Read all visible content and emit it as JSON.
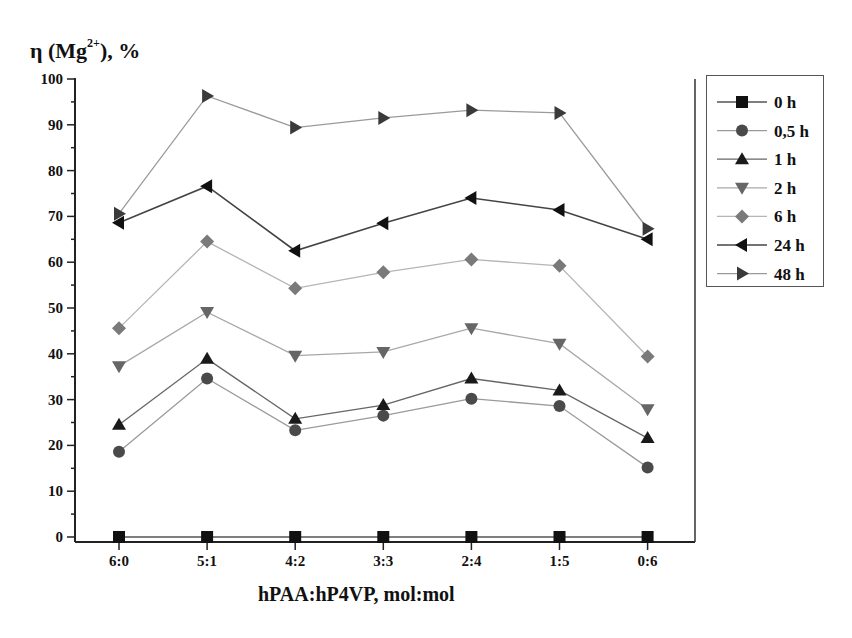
{
  "chart_data": {
    "type": "line",
    "title": "",
    "ylabel": "η (Mg²⁺), %",
    "ylabel_main": "η (Mg",
    "ylabel_sup": "2+",
    "ylabel_tail": "), %",
    "xlabel": "hPAA:hP4VP, mol:mol",
    "categories": [
      "6:0",
      "5:1",
      "4:2",
      "3:3",
      "2:4",
      "1:5",
      "0:6"
    ],
    "ylim": [
      0,
      100
    ],
    "yticks": [
      0,
      10,
      20,
      30,
      40,
      50,
      60,
      70,
      80,
      90,
      100
    ],
    "grid": false,
    "legend_position": "right-outside-top",
    "series": [
      {
        "name": "0 h",
        "marker": "square",
        "color": "#111111",
        "line_color": "#555555",
        "values": [
          0,
          0,
          0,
          0,
          0,
          0,
          0
        ]
      },
      {
        "name": "0,5 h",
        "marker": "circle",
        "color": "#4a4a4a",
        "line_color": "#9a9a9a",
        "values": [
          18.6,
          34.6,
          23.3,
          26.5,
          30.2,
          28.6,
          15.2
        ]
      },
      {
        "name": "1 h",
        "marker": "triangle-up",
        "color": "#1a1a1a",
        "line_color": "#666666",
        "values": [
          24.5,
          38.9,
          25.8,
          28.8,
          34.6,
          32.0,
          21.6
        ]
      },
      {
        "name": "2 h",
        "marker": "triangle-down",
        "color": "#666666",
        "line_color": "#a8a8a8",
        "values": [
          37.3,
          49.1,
          39.6,
          40.4,
          45.6,
          42.2,
          27.9
        ]
      },
      {
        "name": "6 h",
        "marker": "diamond",
        "color": "#7a7a7a",
        "line_color": "#b5b5b5",
        "values": [
          45.6,
          64.5,
          54.3,
          57.8,
          60.6,
          59.2,
          39.4
        ]
      },
      {
        "name": "24 h",
        "marker": "triangle-left",
        "color": "#111111",
        "line_color": "#444444",
        "values": [
          68.6,
          76.6,
          62.5,
          68.5,
          74.0,
          71.4,
          65.0
        ]
      },
      {
        "name": "48 h",
        "marker": "triangle-right",
        "color": "#3a3a3a",
        "line_color": "#9a9a9a",
        "values": [
          70.6,
          96.3,
          89.4,
          91.5,
          93.2,
          92.6,
          67.3
        ]
      }
    ]
  }
}
